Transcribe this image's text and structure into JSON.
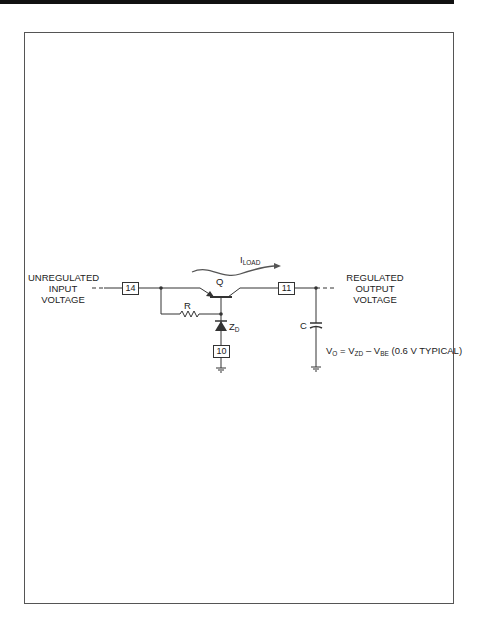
{
  "diagram": {
    "labels": {
      "input": [
        "UNREGULATED",
        "INPUT",
        "VOLTAGE"
      ],
      "output": [
        "REGULATED",
        "OUTPUT",
        "VOLTAGE"
      ],
      "transistor": "Q",
      "resistor": "R",
      "zener": "Z",
      "zener_sub": "D",
      "capacitor": "C",
      "current": "I",
      "current_sub": "LOAD"
    },
    "pins": {
      "input_pin": "14",
      "output_pin": "11",
      "ground_pin": "10"
    },
    "formula": {
      "vo": "V",
      "vo_sub": "O",
      "eq": " = ",
      "vzd": "V",
      "vzd_sub": "ZD",
      "minus": " – ",
      "vbe": "V",
      "vbe_sub": "BE",
      "note": " (0.6 V TYPICAL)"
    }
  }
}
